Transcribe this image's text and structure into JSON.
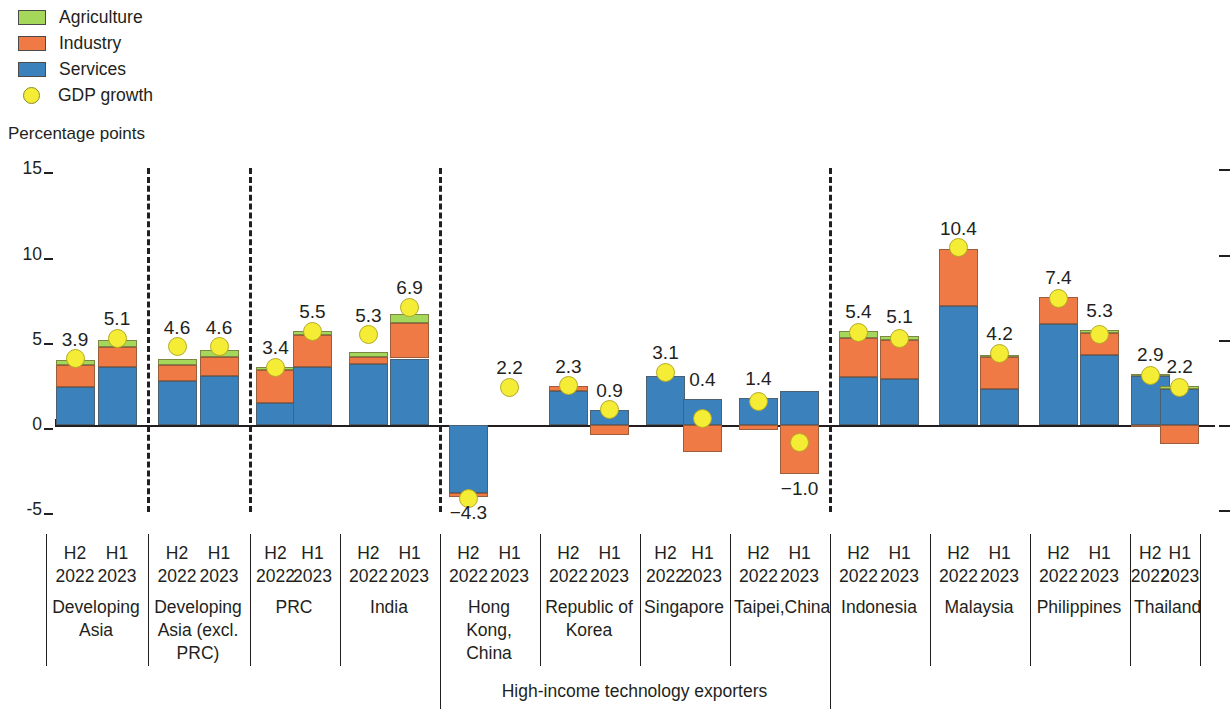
{
  "legend": {
    "items": [
      {
        "label": "Agriculture",
        "icon": "square-swatch-icon",
        "color": "#a5d75a",
        "type": "swatch"
      },
      {
        "label": "Industry",
        "icon": "square-swatch-icon",
        "color": "#f07a45",
        "type": "swatch"
      },
      {
        "label": "Services",
        "icon": "square-swatch-icon",
        "color": "#3b82bd",
        "type": "swatch"
      },
      {
        "label": "GDP growth",
        "icon": "circle-marker-icon",
        "color": "#f5ec36",
        "type": "dot"
      }
    ]
  },
  "axis": {
    "title": "Percentage points",
    "yticks": [
      "15",
      "10",
      "5",
      "0",
      "-5"
    ],
    "supergroup_label": "High-income technology exporters"
  },
  "groups": [
    {
      "name": "Developing\nAsia",
      "periods": [
        "H2\n2022",
        "H1\n2023"
      ]
    },
    {
      "name": "Developing\nAsia (excl.\nPRC)",
      "periods": [
        "H2\n2022",
        "H1\n2023"
      ]
    },
    {
      "name": "PRC",
      "periods": [
        "H2\n2022",
        "H1\n2023"
      ]
    },
    {
      "name": "India",
      "periods": [
        "H2\n2022",
        "H1\n2023"
      ]
    },
    {
      "name": "Hong Kong,\nChina",
      "periods": [
        "H2\n2022",
        "H1\n2023"
      ]
    },
    {
      "name": "Republic of\nKorea",
      "periods": [
        "H2\n2022",
        "H1\n2023"
      ]
    },
    {
      "name": "Singapore",
      "periods": [
        "H2\n2022",
        "H1\n2023"
      ]
    },
    {
      "name": "Taipei,China",
      "periods": [
        "H2\n2022",
        "H1\n2023"
      ]
    },
    {
      "name": "Indonesia",
      "periods": [
        "H2\n2022",
        "H1\n2023"
      ]
    },
    {
      "name": "Malaysia",
      "periods": [
        "H2\n2022",
        "H1\n2023"
      ]
    },
    {
      "name": "Philippines",
      "periods": [
        "H2\n2022",
        "H1\n2023"
      ]
    },
    {
      "name": "Thailand",
      "periods": [
        "H2\n2022",
        "H1\n2023"
      ]
    }
  ],
  "chart_data": {
    "type": "bar",
    "stacked": true,
    "title": "",
    "xlabel": "",
    "ylabel": "Percentage points",
    "ylim": [
      -7,
      15
    ],
    "yticks": [
      -5,
      0,
      5,
      10,
      15
    ],
    "grid": false,
    "legend_position": "top-left",
    "categories": [
      "Developing Asia H2 2022",
      "Developing Asia H1 2023",
      "Developing Asia (excl. PRC) H2 2022",
      "Developing Asia (excl. PRC) H1 2023",
      "PRC H2 2022",
      "PRC H1 2023",
      "India H2 2022",
      "India H1 2023",
      "Hong Kong, China H2 2022",
      "Hong Kong, China H1 2023",
      "Republic of Korea H2 2022",
      "Republic of Korea H1 2023",
      "Singapore H2 2022",
      "Singapore H1 2023",
      "Taipei,China H2 2022",
      "Taipei,China H1 2023",
      "Indonesia H2 2022",
      "Indonesia H1 2023",
      "Malaysia H2 2022",
      "Malaysia H1 2023",
      "Philippines H2 2022",
      "Philippines H1 2023",
      "Thailand H2 2022",
      "Thailand H1 2023"
    ],
    "series": [
      {
        "name": "Services",
        "color": "#3b82bd",
        "values": [
          2.2,
          3.4,
          2.6,
          2.9,
          1.3,
          3.4,
          3.6,
          3.9,
          -4.0,
          0.0,
          2.0,
          0.9,
          2.9,
          1.5,
          1.6,
          2.0,
          2.8,
          2.7,
          7.0,
          2.1,
          5.9,
          4.1,
          2.9,
          2.1
        ]
      },
      {
        "name": "Industry",
        "color": "#f07a45",
        "values": [
          1.3,
          1.2,
          0.9,
          1.1,
          1.9,
          1.9,
          0.4,
          2.1,
          -0.2,
          0.0,
          0.3,
          -0.6,
          0.0,
          -1.6,
          -0.3,
          -2.9,
          2.3,
          2.3,
          3.3,
          1.9,
          1.6,
          1.3,
          -0.1,
          -1.1
        ]
      },
      {
        "name": "Agriculture",
        "color": "#a5d75a",
        "values": [
          0.3,
          0.4,
          0.4,
          0.4,
          0.2,
          0.2,
          0.3,
          0.5,
          0.0,
          0.0,
          0.0,
          0.0,
          0.0,
          0.0,
          0.0,
          0.0,
          0.4,
          0.2,
          0.0,
          0.1,
          0.0,
          0.2,
          0.1,
          0.2
        ]
      }
    ],
    "gdp_growth": {
      "name": "GDP growth",
      "color": "#f5ec36",
      "values": [
        3.9,
        5.1,
        4.6,
        4.6,
        3.4,
        5.5,
        5.3,
        6.9,
        -4.3,
        2.2,
        2.3,
        0.9,
        3.1,
        0.4,
        1.4,
        -1.0,
        5.4,
        5.1,
        10.4,
        4.2,
        7.4,
        5.3,
        2.9,
        2.2
      ],
      "labels": [
        "3.9",
        "5.1",
        "4.6",
        "4.6",
        "3.4",
        "5.5",
        "5.3",
        "6.9",
        "-4.3",
        "2.2",
        "2.3",
        "0.9",
        "3.1",
        "0.4",
        "1.4",
        "-1.0",
        "5.4",
        "5.1",
        "10.4",
        "4.2",
        "7.4",
        "5.3",
        "2.9",
        "2.2"
      ]
    }
  }
}
